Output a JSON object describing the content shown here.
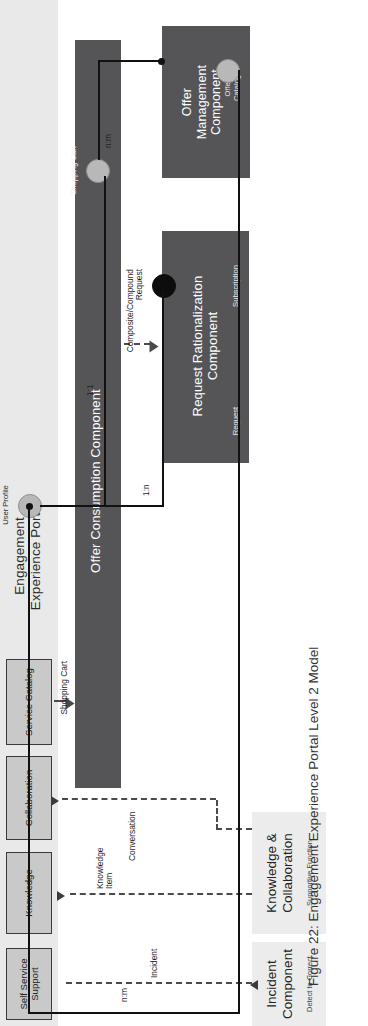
{
  "figure": {
    "caption": "Figure 22: Engagement Experience Portal Level 2 Model"
  },
  "portal": {
    "title": "Engagement\nExperience Portal",
    "lane_color": "#e9e9e9",
    "channels": [
      {
        "label": "Self Service\nSupport"
      },
      {
        "label": "Knowledge"
      },
      {
        "label": "Collaboration"
      },
      {
        "label": "Service Catalog"
      }
    ]
  },
  "components": [
    {
      "name": "offer-consumption-component",
      "label": "Offer Consumption Component",
      "color": "#555558"
    },
    {
      "name": "request-rationalization-component",
      "label": "Request Rationalization\nComponent",
      "color": "#555558",
      "interfaces": [
        {
          "label": "Subscription",
          "style": "dark"
        },
        {
          "label": "Request",
          "style": "none"
        }
      ]
    },
    {
      "name": "offer-management-component",
      "label": "Offer\nManagement\nComponent",
      "color": "#555558",
      "interfaces": [
        {
          "label": "Offer\nCatalog",
          "style": "light"
        }
      ]
    }
  ],
  "outcomes": [
    {
      "name": "incident-component",
      "title": "Incident\nComponent",
      "subtitle": "Detect to Correct",
      "color": "#ececec"
    },
    {
      "name": "knowledge-collaboration",
      "title": "Knowledge &\nCollaboration",
      "subtitle": "Supportive Function",
      "color": "#ececec"
    }
  ],
  "interfaces": [
    {
      "label": "User Profile"
    },
    {
      "label": "Shopping Cart"
    }
  ],
  "edges": [
    {
      "label": "Incident",
      "style": "dashed"
    },
    {
      "label": "Knowledge\nItem",
      "style": "dashed"
    },
    {
      "label": "Conversation",
      "style": "dashed"
    },
    {
      "label": "Shopping Cart",
      "style": "dashed"
    },
    {
      "label": "1:n",
      "style": "solid"
    },
    {
      "label": "1:1",
      "style": "solid"
    },
    {
      "label": "n:m",
      "style": "solid"
    },
    {
      "label": "n:m",
      "style": "solid"
    },
    {
      "label": "Composite/Compound\nRequest",
      "style": "dashed"
    }
  ],
  "colors": {
    "component_fill": "#555558",
    "portal_lane": "#e9e9e9",
    "portal_box": "#c9c9c9",
    "outcome_fill": "#ececec",
    "line": "#111111",
    "dashed_line": "#4a4a4a"
  }
}
